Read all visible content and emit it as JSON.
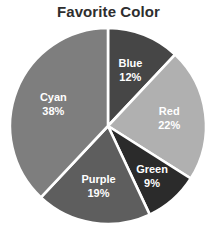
{
  "chart": {
    "title": "Favorite Color",
    "background_color": "#ffffff",
    "title_color": "#2e2e2e",
    "divider_color": "#ffffff",
    "label_color": "#ffffff"
  },
  "chart_data": {
    "type": "pie",
    "title": "Favorite Color",
    "xlabel": "",
    "ylabel": "",
    "legend_position": "none",
    "grid": false,
    "labels_inside_slices": true,
    "start_angle_deg": 0,
    "direction": "clockwise",
    "units": "percent",
    "total": 100,
    "categories": [
      "Blue",
      "Red",
      "Green",
      "Purple",
      "Cyan"
    ],
    "values": [
      12,
      22,
      9,
      19,
      38
    ],
    "value_suffix": "%",
    "slices": [
      {
        "label": "Blue",
        "value": 12,
        "value_text": "12%",
        "color": "#464646",
        "start_deg": 0,
        "end_deg": 43.2
      },
      {
        "label": "Red",
        "value": 22,
        "value_text": "22%",
        "color": "#b0b0b0",
        "start_deg": 43.2,
        "end_deg": 122.4
      },
      {
        "label": "Green",
        "value": 9,
        "value_text": "9%",
        "color": "#2b2b2b",
        "start_deg": 122.4,
        "end_deg": 154.8
      },
      {
        "label": "Purple",
        "value": 19,
        "value_text": "19%",
        "color": "#5e5e5e",
        "start_deg": 154.8,
        "end_deg": 223.2
      },
      {
        "label": "Cyan",
        "value": 38,
        "value_text": "38%",
        "color": "#7e7e7e",
        "start_deg": 223.2,
        "end_deg": 360
      }
    ]
  },
  "geometry": {
    "center_x": 108,
    "center_y": 126,
    "radius": 98
  }
}
